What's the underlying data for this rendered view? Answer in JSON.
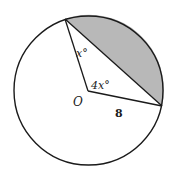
{
  "diagram": {
    "type": "circle-sector-segment",
    "circle": {
      "center_label": "O",
      "radius_label": "8"
    },
    "angles": {
      "inscribed_angle_label": "x°",
      "central_angle_label": "4x°"
    },
    "colors": {
      "stroke": "#1a1a1a",
      "shaded_segment": "#b8b8b8",
      "background": "#ffffff"
    }
  }
}
